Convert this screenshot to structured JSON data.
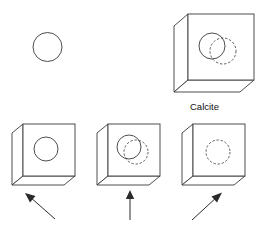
{
  "figure": {
    "background_color": "#ffffff",
    "line_color": "#3a3a3a",
    "arrow_color": "#2b2b2b",
    "text_color": "#111111",
    "width": 263,
    "height": 229
  },
  "labels": {
    "calcite": "Calcite"
  },
  "diagram_data": {
    "type": "diagram",
    "subject": "calcite-double-refraction",
    "source_circle": {
      "shape": "circle",
      "style": "solid",
      "cx": 47.5,
      "cy": 47.0,
      "r": 14.5
    },
    "crystals": [
      {
        "id": "calcite-top",
        "label": "Calcite",
        "front": {
          "x": 188.0,
          "y": 14.0,
          "w": 66.0,
          "h": 66.0
        },
        "depth_dx": -14.0,
        "depth_dy": 12.0,
        "circles": [
          {
            "style": "solid",
            "cx": 212.0,
            "cy": 46.0,
            "r": 13.0
          },
          {
            "style": "dashed",
            "cx": 223.0,
            "cy": 51.0,
            "r": 13.0
          }
        ],
        "caption": {
          "text": "Calcite",
          "x": 190.0,
          "y": 110.0
        }
      },
      {
        "id": "view-left",
        "front": {
          "x": 23.0,
          "y": 124.0,
          "w": 52.0,
          "h": 52.0
        },
        "depth_dx": -11.0,
        "depth_dy": 9.0,
        "circles": [
          {
            "style": "solid",
            "cx": 46.0,
            "cy": 149.0,
            "r": 12.0
          }
        ]
      },
      {
        "id": "view-center",
        "front": {
          "x": 108.0,
          "y": 124.0,
          "w": 52.0,
          "h": 52.0
        },
        "depth_dx": -11.0,
        "depth_dy": 9.0,
        "circles": [
          {
            "style": "solid",
            "cx": 129.0,
            "cy": 147.0,
            "r": 12.0
          },
          {
            "style": "dashed",
            "cx": 136.0,
            "cy": 152.0,
            "r": 12.0
          }
        ]
      },
      {
        "id": "view-right",
        "front": {
          "x": 193.0,
          "y": 124.0,
          "w": 52.0,
          "h": 52.0
        },
        "depth_dx": -11.0,
        "depth_dy": 9.0,
        "circles": [
          {
            "style": "dashed",
            "cx": 218.0,
            "cy": 152.0,
            "r": 12.0
          }
        ]
      }
    ],
    "arrows": [
      {
        "id": "arrow-up-left",
        "direction": "up-left",
        "tail_x": 55.0,
        "tail_y": 219.0,
        "tip_x": 26.0,
        "tip_y": 194.0
      },
      {
        "id": "arrow-up",
        "direction": "up",
        "tail_x": 130.0,
        "tail_y": 220.0,
        "tip_x": 130.0,
        "tip_y": 191.0
      },
      {
        "id": "arrow-up-right",
        "direction": "up-right",
        "tail_x": 192.0,
        "tail_y": 220.0,
        "tip_x": 221.0,
        "tip_y": 193.0
      }
    ]
  }
}
